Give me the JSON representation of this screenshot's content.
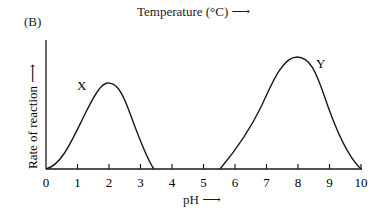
{
  "header": {
    "top_title": "Temperature (°C) ⟶",
    "panel_label": "(B)"
  },
  "chart_data": {
    "type": "line",
    "title": "",
    "panel": "(B)",
    "xlabel": "pH ⟶",
    "ylabel": "Rate of reaction ⟶",
    "xlim": [
      0,
      10
    ],
    "ylim": [
      0,
      100
    ],
    "x_ticks": [
      "0",
      "1",
      "2",
      "3",
      "4",
      "5",
      "6",
      "7",
      "8",
      "9",
      "10"
    ],
    "y_ticks": [],
    "grid": false,
    "legend": null,
    "series": [
      {
        "name": "X",
        "x": [
          0,
          0.5,
          1.0,
          1.5,
          1.9,
          2.3,
          2.7,
          3.1,
          3.5
        ],
        "values": [
          0,
          8,
          35,
          60,
          67,
          60,
          35,
          10,
          0
        ],
        "peak": {
          "x": 1.9,
          "y": 67
        }
      },
      {
        "name": "Y",
        "x": [
          5.6,
          6.2,
          6.8,
          7.4,
          8.0,
          8.5,
          9.0,
          9.5,
          10.0
        ],
        "values": [
          0,
          15,
          45,
          78,
          87,
          80,
          50,
          18,
          0
        ],
        "peak": {
          "x": 8.0,
          "y": 87
        }
      }
    ],
    "annotations": [
      "X",
      "Y"
    ]
  }
}
